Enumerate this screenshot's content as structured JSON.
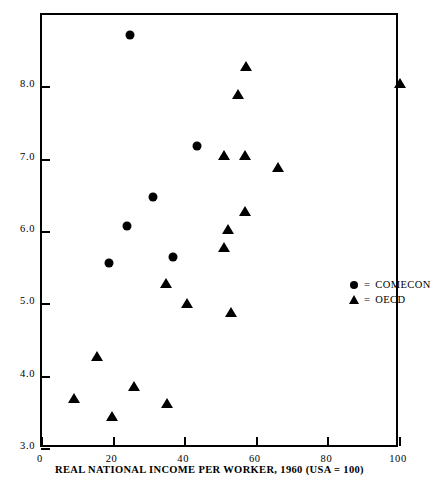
{
  "chart_data": {
    "type": "scatter",
    "title": "",
    "xlabel": "REAL NATIONAL INCOME PER WORKER, 1960 (USA = 100)",
    "ylabel": "",
    "xlim": [
      0,
      100
    ],
    "ylim": [
      3.0,
      9.0
    ],
    "xticks": [
      0,
      20,
      40,
      60,
      80,
      100
    ],
    "xtick_labels": [
      "0",
      "20",
      "40",
      "60",
      "80",
      "100"
    ],
    "yticks": [
      3.0,
      4.0,
      5.0,
      6.0,
      7.0,
      8.0
    ],
    "ytick_labels": [
      "3.0",
      "4.0",
      "5.0",
      "6.0",
      "7.0",
      "8.0"
    ],
    "grid": false,
    "legend_position": "center-right",
    "series": [
      {
        "name": "COMECON",
        "marker": "circle",
        "color": "#000000",
        "points": [
          {
            "x": 24.6,
            "y": 8.73
          },
          {
            "x": 43.2,
            "y": 7.19
          },
          {
            "x": 30.9,
            "y": 6.48
          },
          {
            "x": 23.8,
            "y": 6.08
          },
          {
            "x": 36.7,
            "y": 5.65
          },
          {
            "x": 18.8,
            "y": 5.57
          }
        ]
      },
      {
        "name": "OECD",
        "marker": "triangle",
        "color": "#000000",
        "points": [
          {
            "x": 56.9,
            "y": 8.28
          },
          {
            "x": 100.0,
            "y": 8.05
          },
          {
            "x": 54.8,
            "y": 7.9
          },
          {
            "x": 50.7,
            "y": 7.05
          },
          {
            "x": 56.7,
            "y": 7.05
          },
          {
            "x": 65.8,
            "y": 6.88
          },
          {
            "x": 56.6,
            "y": 6.27
          },
          {
            "x": 51.9,
            "y": 6.03
          },
          {
            "x": 50.9,
            "y": 5.78
          },
          {
            "x": 34.6,
            "y": 5.28
          },
          {
            "x": 40.5,
            "y": 5.0
          },
          {
            "x": 52.8,
            "y": 4.88
          },
          {
            "x": 15.5,
            "y": 4.27
          },
          {
            "x": 25.8,
            "y": 3.86
          },
          {
            "x": 8.9,
            "y": 3.69
          },
          {
            "x": 34.8,
            "y": 3.62
          },
          {
            "x": 19.6,
            "y": 3.44
          }
        ]
      }
    ],
    "legend": [
      {
        "marker": "circle",
        "equals": "=",
        "label": "COMECON"
      },
      {
        "marker": "triangle",
        "equals": "=",
        "label": "OECD"
      }
    ]
  }
}
